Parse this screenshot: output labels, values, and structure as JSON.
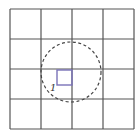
{
  "diagram": {
    "grid": {
      "rows": 4,
      "cols": 4,
      "x0": 10,
      "y0": 9,
      "x1": 134,
      "y1": 129,
      "line_color": "#555555"
    },
    "circle": {
      "cx": 71,
      "cy": 72,
      "r": 30,
      "style": "dashed",
      "color": "#444444"
    },
    "square": {
      "x": 57,
      "y": 70,
      "size": 15,
      "color": "#7a73b8"
    },
    "label": {
      "text": "1",
      "x": 50,
      "y": 91
    }
  }
}
